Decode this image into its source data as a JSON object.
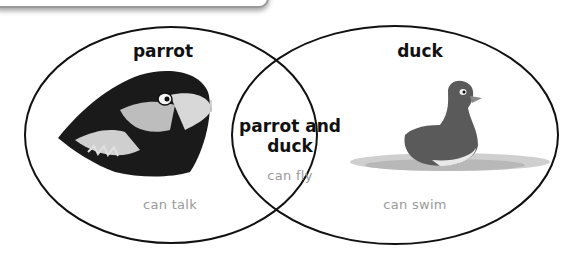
{
  "diagram": {
    "type": "venn",
    "sets": [
      {
        "id": "left",
        "title": "parrot",
        "trait": "can talk",
        "image": "parrot-head-illustration"
      },
      {
        "id": "right",
        "title": "duck",
        "trait": "can swim",
        "image": "duck-swimming-illustration"
      }
    ],
    "intersection": {
      "title": "parrot and duck",
      "title_line1": "parrot and",
      "title_line2": "duck",
      "trait": "can fly"
    },
    "colors": {
      "outline": "#111111",
      "label": "#111111",
      "trait": "#9a9a9a"
    }
  }
}
